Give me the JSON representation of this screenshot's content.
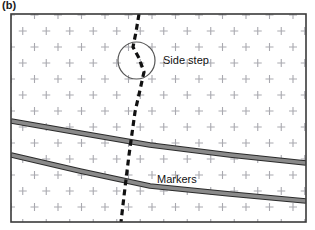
{
  "figure": {
    "panel_label": "(b)",
    "frame": {
      "x": 11,
      "y": 14,
      "width": 295,
      "height": 208,
      "border_color": "#3a3a3a",
      "fill_color": "#ffffff"
    },
    "background_pattern": {
      "glyph": "plus-sign",
      "color": "#a9a9b0",
      "arrangement": "staggered-grid",
      "col_spacing": 23.5,
      "row_spacing": 16,
      "row_offset": 11.75,
      "arm_length": 4
    },
    "annotations": [
      {
        "id": "side-step",
        "label": "Side step",
        "x": 163,
        "y": 64
      },
      {
        "id": "markers",
        "label": "Markers",
        "x": 157,
        "y": 183
      }
    ],
    "highlight_circle": {
      "cx": 136.5,
      "cy": 60.5,
      "r": 18.5,
      "color": "#555555"
    },
    "dashed_path": {
      "id": "side-step-path",
      "color": "#111111",
      "stroke_width": 3.2,
      "dash": "6 4",
      "points": [
        [
          139,
          14
        ],
        [
          136,
          32
        ],
        [
          133,
          47
        ],
        [
          139,
          58
        ],
        [
          144,
          72
        ],
        [
          140,
          90
        ],
        [
          135,
          112
        ],
        [
          129,
          155
        ],
        [
          124,
          196
        ],
        [
          121,
          222
        ]
      ]
    },
    "markers_lines": [
      {
        "id": "marker-upper",
        "fill": "#8a8a8a",
        "edge": "#2b2b2b",
        "thickness": 5.5,
        "points": [
          [
            11,
            121
          ],
          [
            80,
            133
          ],
          [
            150,
            145
          ],
          [
            230,
            155
          ],
          [
            306,
            163
          ]
        ]
      },
      {
        "id": "marker-lower",
        "fill": "#8a8a8a",
        "edge": "#2b2b2b",
        "thickness": 5.5,
        "points": [
          [
            11,
            155
          ],
          [
            80,
            171
          ],
          [
            150,
            186
          ],
          [
            230,
            194
          ],
          [
            306,
            201
          ]
        ]
      }
    ]
  }
}
